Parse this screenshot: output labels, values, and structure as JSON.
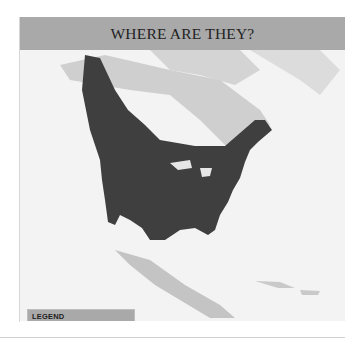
{
  "header": {
    "title": "WHERE ARE THEY?"
  },
  "map": {
    "region": "North America",
    "range_color": "#3f3f3f",
    "land_color": "#c9c9c9",
    "water_color": "#f3f3f3"
  },
  "legend": {
    "title": "LEGEND",
    "items": [
      {
        "label": "Year Round",
        "color": "#444444"
      }
    ]
  }
}
